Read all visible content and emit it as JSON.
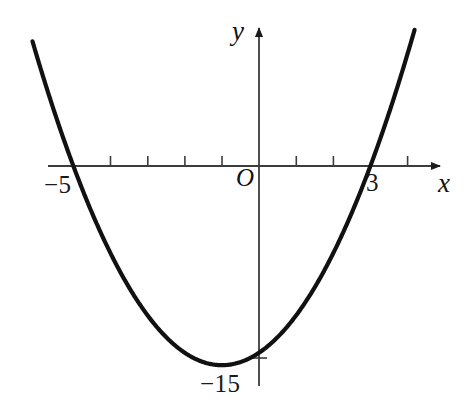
{
  "figure": {
    "kind": "coordinate-graph",
    "background_color": "#ffffff",
    "curve_color": "#111111",
    "axis_color": "#3c3c3c",
    "label_color": "#111111"
  },
  "axes": {
    "x_axis_label": "x",
    "y_axis_label": "y",
    "origin_label": "O",
    "x_axis_has_arrow": true,
    "y_axis_has_arrow": true,
    "x_axis_tick_values": [
      -4,
      -3,
      -2,
      -1,
      1,
      2,
      4
    ],
    "y_axis_tick_values": [
      -15
    ],
    "x_range": [
      -6.1,
      4.4
    ],
    "y_range": [
      -17.6,
      11.0
    ],
    "grid": "off"
  },
  "labels": {
    "root_left": "−5",
    "root_right": "3",
    "y_intercept": "−15"
  },
  "chart_data": {
    "type": "line",
    "title": "",
    "subtitle": "",
    "xlabel": "x",
    "ylabel": "y",
    "legend": [],
    "legend_position": "none",
    "grid": false,
    "xlim": [
      -6.1,
      4.4
    ],
    "ylim": [
      -17.6,
      11.0
    ],
    "xticks": [
      -4,
      -3,
      -2,
      -1,
      1,
      2,
      4
    ],
    "xtick_labels": [
      "",
      "",
      "",
      "",
      "",
      "",
      ""
    ],
    "yticks": [
      -15
    ],
    "ytick_labels": [
      "−15"
    ],
    "annotations": [
      {
        "text": "−5",
        "x": -5,
        "y": 0,
        "note": "left x-intercept"
      },
      {
        "text": "3",
        "x": 3,
        "y": 0,
        "note": "right x-intercept"
      },
      {
        "text": "−15",
        "x": 0,
        "y": -15,
        "note": "y-intercept"
      },
      {
        "text": "O",
        "x": 0,
        "y": 0,
        "note": "origin"
      }
    ],
    "series": [
      {
        "name": "parabola",
        "equation": "y = x^2 + 2x - 15",
        "roots": [
          -5,
          3
        ],
        "vertex": [
          -1,
          -16
        ],
        "y_intercept": -15,
        "x": [
          -6.1,
          -5.8,
          -5.5,
          -5.2,
          -5.0,
          -4.6,
          -4.2,
          -3.8,
          -3.4,
          -3.0,
          -2.6,
          -2.2,
          -1.8,
          -1.4,
          -1.0,
          -0.6,
          -0.2,
          0.2,
          0.6,
          1.0,
          1.4,
          1.8,
          2.2,
          2.6,
          3.0,
          3.4,
          3.8,
          4.1,
          4.4
        ],
        "y": [
          9.41,
          6.04,
          2.75,
          -0.76,
          -3.0,
          -5.16,
          -6.96,
          -8.16,
          -9.24,
          -10.0,
          -10.44,
          -10.56,
          -10.36,
          -9.84,
          -9.0,
          -7.84,
          -6.36,
          -4.56,
          -2.44,
          0.0,
          2.76,
          5.84,
          9.24,
          12.96,
          16.0,
          19.84,
          24.4,
          27.9,
          30.3
        ]
      }
    ]
  }
}
